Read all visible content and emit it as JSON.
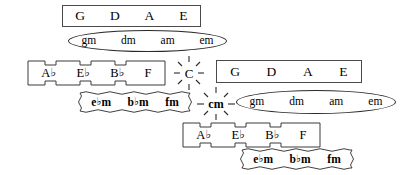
{
  "diagram": {
    "stroke_color": "#3b3b3b",
    "background_color": "#ffffff",
    "flat_glyph": "♭"
  },
  "groups": {
    "top_major_rect": {
      "shape": "rectangle",
      "labels": [
        "G",
        "D",
        "A",
        "E"
      ]
    },
    "top_minor_ellipse": {
      "shape": "ellipse",
      "labels": [
        "gm",
        "dm",
        "am",
        "em"
      ]
    },
    "left_major_puzzle": {
      "shape": "castellated",
      "labels": [
        {
          "root": "A",
          "accidental": "♭"
        },
        {
          "root": "E",
          "accidental": "♭"
        },
        {
          "root": "B",
          "accidental": "♭"
        },
        {
          "root": "F",
          "accidental": ""
        }
      ]
    },
    "left_minor_wavy": {
      "shape": "wavy",
      "labels": [
        {
          "root": "e",
          "accidental": "♭",
          "suffix": "m"
        },
        {
          "root": "b",
          "accidental": "♭",
          "suffix": "m"
        },
        {
          "root": "f",
          "accidental": "",
          "suffix": "m"
        }
      ]
    },
    "center_major_sun": {
      "shape": "sunburst",
      "label": "C"
    },
    "center_minor_sun": {
      "shape": "sunburst",
      "label": "cm"
    },
    "right_major_rect": {
      "shape": "rectangle",
      "labels": [
        "G",
        "D",
        "A",
        "E"
      ]
    },
    "right_minor_ellipse": {
      "shape": "ellipse",
      "labels": [
        "gm",
        "dm",
        "am",
        "em"
      ]
    },
    "bottom_major_puzzle": {
      "shape": "castellated",
      "labels": [
        {
          "root": "A",
          "accidental": "♭"
        },
        {
          "root": "E",
          "accidental": "♭"
        },
        {
          "root": "B",
          "accidental": "♭"
        },
        {
          "root": "F",
          "accidental": ""
        }
      ]
    },
    "bottom_minor_wavy": {
      "shape": "wavy",
      "labels": [
        {
          "root": "e",
          "accidental": "♭",
          "suffix": "m"
        },
        {
          "root": "b",
          "accidental": "♭",
          "suffix": "m"
        },
        {
          "root": "f",
          "accidental": "",
          "suffix": "m"
        }
      ]
    }
  }
}
